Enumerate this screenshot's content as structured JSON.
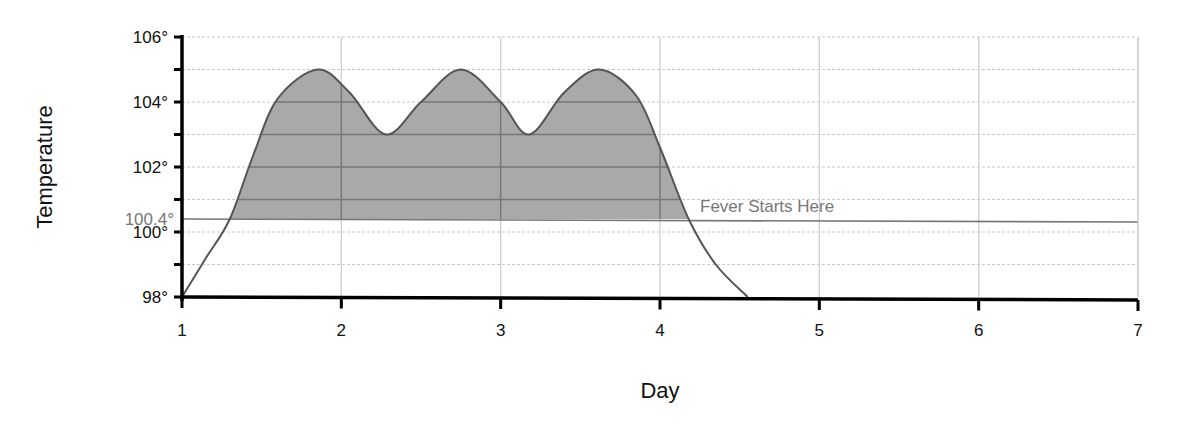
{
  "chart_data": {
    "type": "area",
    "title": "",
    "xlabel": "Day",
    "ylabel": "Temperature",
    "xlim": [
      1,
      7
    ],
    "ylim": [
      98,
      106
    ],
    "x_ticks": [
      1,
      2,
      3,
      4,
      5,
      6,
      7
    ],
    "x_tick_labels": [
      "1",
      "2",
      "3",
      "4",
      "5",
      "6",
      "7"
    ],
    "y_ticks": [
      98,
      99,
      100,
      101,
      102,
      103,
      104,
      105,
      106
    ],
    "y_tick_labels": [
      "98°",
      "",
      "100°",
      "",
      "102°",
      "",
      "104°",
      "",
      "106°"
    ],
    "grid": {
      "horizontal": "dotted",
      "vertical": "solid"
    },
    "legend": null,
    "series": [
      {
        "name": "Temperature",
        "x": [
          1.0,
          1.15,
          1.3,
          1.45,
          1.6,
          1.85,
          2.05,
          2.28,
          2.5,
          2.75,
          3.0,
          3.18,
          3.4,
          3.62,
          3.85,
          4.0,
          4.18,
          4.35,
          4.55
        ],
        "values": [
          98.0,
          99.2,
          100.4,
          102.4,
          104.1,
          105.0,
          104.3,
          103.0,
          104.0,
          105.0,
          104.0,
          103.0,
          104.3,
          105.0,
          104.2,
          102.6,
          100.4,
          99.0,
          98.0
        ]
      }
    ],
    "threshold": {
      "value": 100.4,
      "label": "100.4°",
      "annotation": "Fever Starts Here"
    },
    "shaded_region": "area under curve above 100.4° (fever)",
    "colors": {
      "fill": "#a9a9a9",
      "curve": "#555555",
      "threshold": "#777777",
      "axis": "#000000",
      "grid": "#c8c8c8"
    }
  }
}
